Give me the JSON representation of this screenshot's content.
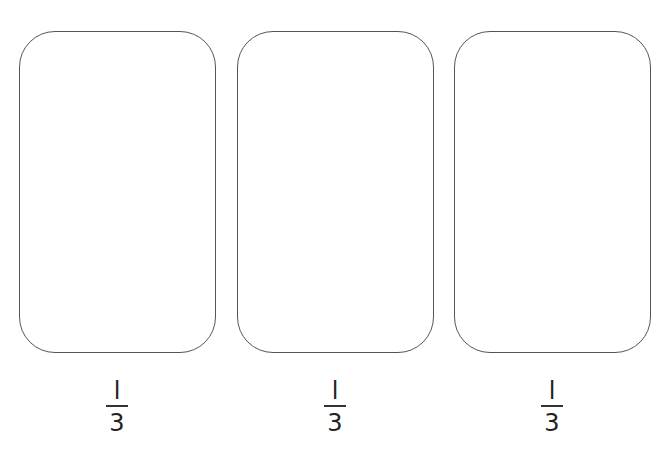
{
  "cards": [
    {
      "left": 19,
      "width": 197,
      "fraction": {
        "numerator": "l",
        "denominator": "3"
      }
    },
    {
      "left": 237,
      "width": 197,
      "fraction": {
        "numerator": "l",
        "denominator": "3"
      }
    },
    {
      "left": 454,
      "width": 197,
      "fraction": {
        "numerator": "l",
        "denominator": "3"
      }
    }
  ],
  "colors": {
    "stroke": "#555555",
    "text": "#222222",
    "background": "#ffffff"
  }
}
